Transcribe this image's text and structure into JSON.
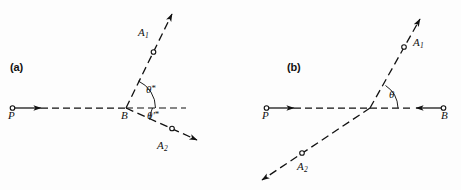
{
  "figure": {
    "width": 461,
    "height": 190,
    "background_color": "#fdfdfd",
    "ink_color": "#111111"
  },
  "panels": [
    {
      "id": "a",
      "label": "(a)",
      "description": "Two outgoing rays from vertex B with angles theta-star and theta-prime-star measured from the horizontal dashed reference line",
      "labels": {
        "incoming_point": "P",
        "vertex": "B",
        "ray_upper": "A",
        "ray_upper_sub": "1",
        "ray_lower": "A",
        "ray_lower_sub": "2",
        "angle_upper": "θ",
        "angle_upper_sup": "*",
        "angle_lower": "θ′",
        "angle_lower_sup": "*"
      }
    },
    {
      "id": "b",
      "label": "(b)",
      "description": "A single straight dashed line crossing the horizontal P-to-B line, with angle theta at the crossing",
      "labels": {
        "left_point": "P",
        "right_point": "B",
        "ray_upper": "A",
        "ray_upper_sub": "1",
        "ray_lower": "A",
        "ray_lower_sub": "2",
        "angle": "θ"
      }
    }
  ]
}
